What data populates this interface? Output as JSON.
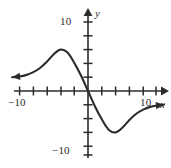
{
  "figure": {
    "name": "cubic-like-odd-function-graph",
    "background_color": "#ffffff",
    "ink_color": "#2b2b2b"
  },
  "axes": {
    "x_axis_label": "x",
    "y_axis_label": "y",
    "x_tick_label_negative": "−10",
    "x_tick_label_positive": "10",
    "y_tick_label_positive": "10",
    "y_tick_label_negative": "−10",
    "origin_px": {
      "x": 88,
      "y": 91
    },
    "pixels_per_unit": 6.9,
    "tick_interval_units": 2
  },
  "chart_data": {
    "type": "line",
    "title": "",
    "subtitle": "",
    "xlabel": "x",
    "ylabel": "y",
    "xlim": [
      -11,
      11
    ],
    "ylim": [
      -11,
      11
    ],
    "xticks": [
      -10,
      -8,
      -6,
      -4,
      -2,
      2,
      4,
      6,
      8,
      10
    ],
    "yticks": [
      -10,
      -8,
      -6,
      -4,
      -2,
      2,
      4,
      6,
      8,
      10
    ],
    "xtick_labels_shown": [
      "-10",
      "10"
    ],
    "ytick_labels_shown": [
      "10",
      "-10"
    ],
    "grid": false,
    "legend": null,
    "annotations": [
      {
        "text": "arrow-left-end",
        "x": -11,
        "y": 2
      },
      {
        "text": "arrow-right-end",
        "x": 11,
        "y": -2
      }
    ],
    "series": [
      {
        "name": "curve",
        "description": "Odd-symmetric decreasing sigmoid/cubic-like curve with local maximum near (-4, 6) and local minimum near (4, -6), passing steeply through the origin, flattening toward horizontal asymptotic behavior at both ends.",
        "x": [
          -11,
          -10,
          -9,
          -8,
          -7,
          -6,
          -5,
          -4,
          -3,
          -2,
          -1,
          0,
          1,
          2,
          3,
          4,
          5,
          6,
          7,
          8,
          9,
          10,
          11
        ],
        "y": [
          2.0,
          2.1,
          2.3,
          2.7,
          3.3,
          4.2,
          5.3,
          6.0,
          5.6,
          4.1,
          2.2,
          0.0,
          -2.2,
          -4.1,
          -5.6,
          -6.0,
          -5.3,
          -4.2,
          -3.3,
          -2.7,
          -2.3,
          -2.1,
          -2.0
        ]
      }
    ],
    "features": {
      "local_maximum": {
        "x": -4,
        "y": 6
      },
      "local_minimum": {
        "x": 4,
        "y": -6
      },
      "x_intercept": {
        "x": 0,
        "y": 0
      },
      "y_intercept": {
        "x": 0,
        "y": 0
      },
      "symmetry": "odd (origin symmetric)"
    }
  }
}
